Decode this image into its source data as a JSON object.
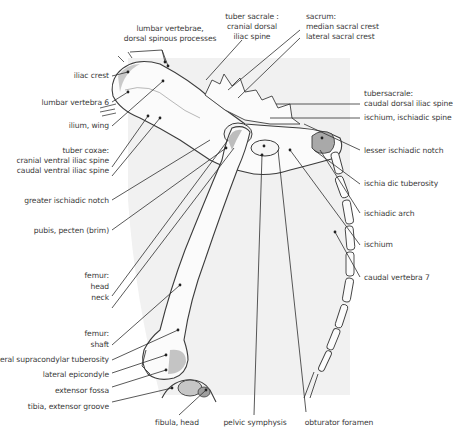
{
  "figure": {
    "colors": {
      "background_panel": "#f1f1f1",
      "bone_fill": "#fbfbfb",
      "bone_outline": "#3c3c3c",
      "shading": "#bdbdbd",
      "leader_line": "#2e2e2e",
      "label_text": "#3a3a3a"
    }
  },
  "labels": {
    "top": [
      {
        "id": "lumbar-vertebrae",
        "lines": [
          "lumbar vertebrae,",
          "dorsal spinous processes"
        ]
      },
      {
        "id": "tuber-sacrale",
        "lines": [
          "tuber sacrale :",
          "cranial dorsal",
          "iliac spine"
        ]
      },
      {
        "id": "sacrum",
        "lines": [
          "sacrum:",
          "median sacral crest",
          "lateral sacral crest"
        ]
      }
    ],
    "left": [
      {
        "id": "iliac-crest",
        "lines": [
          "iliac crest"
        ]
      },
      {
        "id": "lumbar-vertebra-6",
        "lines": [
          "lumbar vertebra 6"
        ]
      },
      {
        "id": "ilium-wing",
        "lines": [
          "ilium, wing"
        ]
      },
      {
        "id": "tuber-coxae",
        "lines": [
          "tuber coxae:",
          "cranial ventral iliac spine",
          "caudal ventral iliac spine"
        ]
      },
      {
        "id": "greater-ischiadic-notch",
        "lines": [
          "greater ischiadic notch"
        ]
      },
      {
        "id": "pubis-pecten",
        "lines": [
          "pubis, pecten (brim)"
        ]
      },
      {
        "id": "femur-head-neck",
        "lines": [
          "femur:",
          "head",
          "neck"
        ]
      },
      {
        "id": "femur-shaft",
        "lines": [
          "femur:",
          "shaft"
        ]
      },
      {
        "id": "lateral-supracondylar-tuberosity",
        "lines": [
          "lateral supracondylar tuberosity"
        ]
      },
      {
        "id": "lateral-epicondyle",
        "lines": [
          "lateral epicondyle"
        ]
      },
      {
        "id": "extensor-fossa",
        "lines": [
          "extensor fossa"
        ]
      },
      {
        "id": "tibia-extensor-groove",
        "lines": [
          "tibia, extensor groove"
        ]
      }
    ],
    "right": [
      {
        "id": "tuber-sacrale-caudal",
        "lines": [
          "tubersacrale:",
          "caudal dorsal  iliac spine"
        ]
      },
      {
        "id": "ischiadic-spine",
        "lines": [
          "ischium, ischiadic spine"
        ]
      },
      {
        "id": "lesser-ischiadic-notch",
        "lines": [
          "lesser ischiadic notch"
        ]
      },
      {
        "id": "ischiadic-tuberosity",
        "lines": [
          "ischia dic tuberosity"
        ]
      },
      {
        "id": "ischiadic-arch",
        "lines": [
          "ischiadic arch"
        ]
      },
      {
        "id": "ischium",
        "lines": [
          "ischium"
        ]
      },
      {
        "id": "caudal-vertebra-7",
        "lines": [
          "caudal vertebra 7"
        ]
      }
    ],
    "bottom": [
      {
        "id": "fibula-head",
        "lines": [
          "fibula, head"
        ]
      },
      {
        "id": "pelvic-symphysis",
        "lines": [
          "pelvic symphysis"
        ]
      },
      {
        "id": "obturator-foramen",
        "lines": [
          "obturator foramen"
        ]
      }
    ]
  }
}
